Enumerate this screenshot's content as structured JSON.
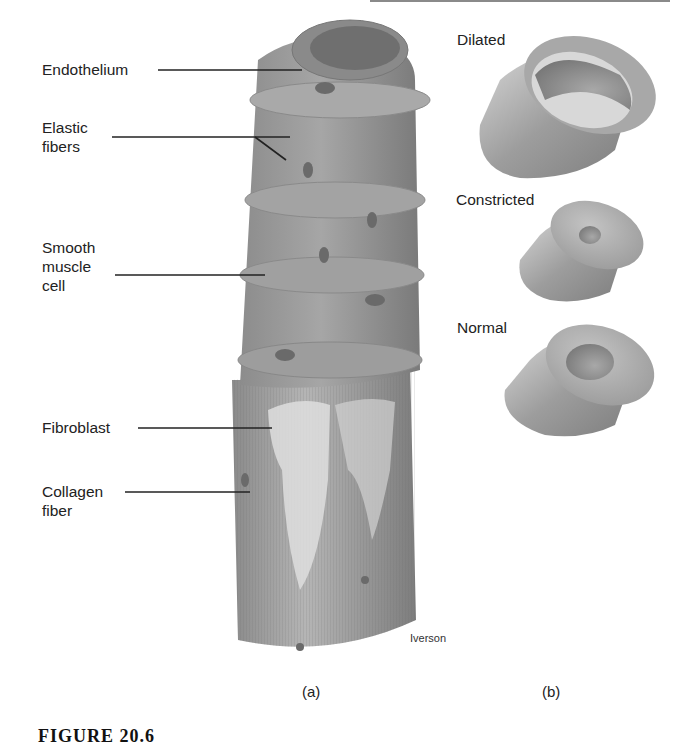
{
  "figure": {
    "caption": "FIGURE 20.6",
    "credit": "Iverson",
    "panels": [
      {
        "tag": "(a)",
        "subject": "vessel wall layers"
      },
      {
        "tag": "(b)",
        "subject": "vessel diameter states"
      }
    ]
  },
  "panel_a": {
    "labels": [
      {
        "text": "Endothelium"
      },
      {
        "text": "Elastic fibers",
        "lines": [
          "Elastic",
          "fibers"
        ]
      },
      {
        "text": "Smooth muscle cell",
        "lines": [
          "Smooth",
          "muscle",
          "cell"
        ]
      },
      {
        "text": "Fibroblast"
      },
      {
        "text": "Collagen fiber",
        "lines": [
          "Collagen",
          "fiber"
        ]
      }
    ]
  },
  "panel_b": {
    "states": [
      {
        "label": "Dilated",
        "lumen": "large"
      },
      {
        "label": "Constricted",
        "lumen": "small"
      },
      {
        "label": "Normal",
        "lumen": "medium"
      }
    ]
  },
  "colors": {
    "tissue_dark": "#6e6e6e",
    "tissue_mid": "#9a9a9a",
    "tissue_light": "#d0d0d0",
    "text": "#222222"
  }
}
